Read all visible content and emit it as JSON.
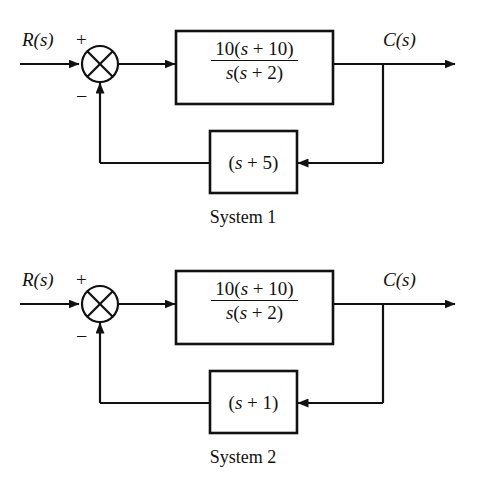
{
  "figure": {
    "type": "control-block-diagram",
    "background": "#ffffff",
    "line_color": "#111111"
  },
  "systems": [
    {
      "caption": "System 1",
      "input_label": "R(s)",
      "output_label": "C(s)",
      "summing_junction": {
        "type": "circle-with-x",
        "positive_sign": "+",
        "negative_sign": "−"
      },
      "forward_block": {
        "numerator": "10(s + 10)",
        "denominator": "s(s + 2)",
        "num_coefficient": "10",
        "num_zero": "s + 10",
        "den_pole_1": "s",
        "den_pole_2": "s + 2"
      },
      "feedback_block": {
        "expression": "(s + 1)",
        "open_paren": "(",
        "variable": "s",
        "operator": "+",
        "constant": "5",
        "close_paren": ")",
        "label": "(s + 5)"
      }
    },
    {
      "caption": "System 2",
      "input_label": "R(s)",
      "output_label": "C(s)",
      "summing_junction": {
        "type": "circle-with-x",
        "positive_sign": "+",
        "negative_sign": "−"
      },
      "forward_block": {
        "numerator": "10(s + 10)",
        "denominator": "s(s + 2)",
        "num_coefficient": "10",
        "num_zero": "s + 10",
        "den_pole_1": "s",
        "den_pole_2": "s + 2"
      },
      "feedback_block": {
        "expression": "(s + 1)",
        "open_paren": "(",
        "variable": "s",
        "operator": "+",
        "constant": "1",
        "close_paren": ")",
        "label": "(s + 1)"
      }
    }
  ]
}
